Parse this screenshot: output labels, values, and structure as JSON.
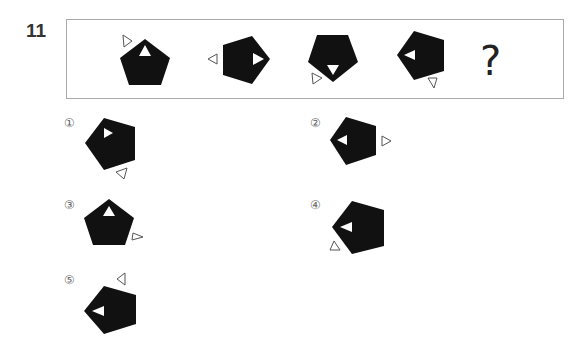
{
  "question": {
    "number": "11",
    "sequence": [
      {
        "id": "fig1",
        "description": "pentagon apex up, inner white triangle up, outline triangle top-left pointing right"
      },
      {
        "id": "fig2",
        "description": "pentagon apex right, inner white triangle right, outline triangle left pointing left"
      },
      {
        "id": "fig3",
        "description": "pentagon apex down, inner white triangle down, outline triangle bottom-left"
      },
      {
        "id": "fig4",
        "description": "pentagon apex left, inner white triangle left, outline triangle bottom-right"
      }
    ],
    "unknown": "?"
  },
  "options": [
    {
      "label": "①"
    },
    {
      "label": "②"
    },
    {
      "label": "③"
    },
    {
      "label": "④"
    },
    {
      "label": "⑤"
    }
  ],
  "colors": {
    "fill": "#111111",
    "outline": "#555555",
    "border": "#aaaaaa"
  }
}
